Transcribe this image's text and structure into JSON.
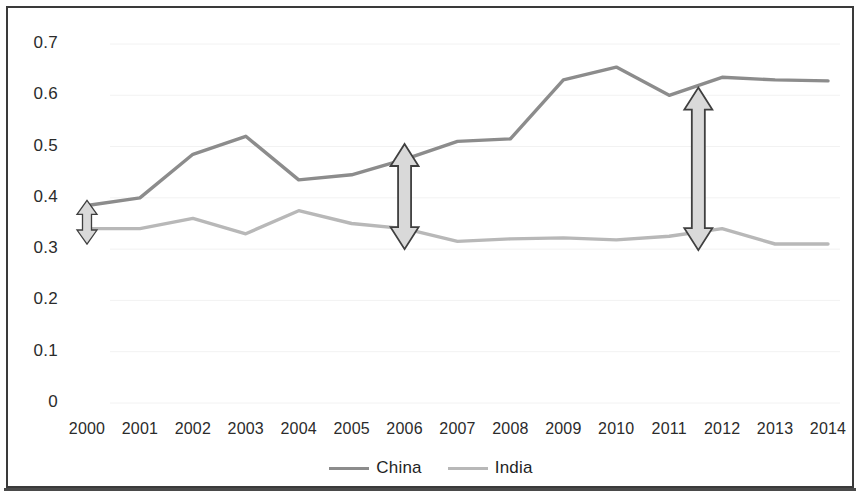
{
  "chart_data": {
    "type": "line",
    "title": "",
    "subtitle": "",
    "xlabel": "",
    "ylabel": "",
    "x": [
      2000,
      2001,
      2002,
      2003,
      2004,
      2005,
      2006,
      2007,
      2008,
      2009,
      2010,
      2011,
      2012,
      2013,
      2014
    ],
    "categories": [
      "2000",
      "2001",
      "2002",
      "2003",
      "2004",
      "2005",
      "2006",
      "2007",
      "2008",
      "2009",
      "2010",
      "2011",
      "2012",
      "2013",
      "2014"
    ],
    "series": [
      {
        "name": "China",
        "color": "#8c8c8c",
        "values": [
          0.385,
          0.4,
          0.485,
          0.52,
          0.435,
          0.445,
          0.475,
          0.51,
          0.515,
          0.63,
          0.655,
          0.6,
          0.635,
          0.63,
          0.628
        ]
      },
      {
        "name": "India",
        "color": "#b8b8b8",
        "values": [
          0.34,
          0.34,
          0.36,
          0.33,
          0.375,
          0.35,
          0.34,
          0.315,
          0.32,
          0.322,
          0.318,
          0.325,
          0.34,
          0.31,
          0.31
        ]
      }
    ],
    "ylim": [
      0,
      0.7
    ],
    "xlim": [
      2000,
      2014
    ],
    "yticks": [
      "0",
      "0.1",
      "0.2",
      "0.3",
      "0.4",
      "0.5",
      "0.6",
      "0.7"
    ],
    "ytick_values": [
      0,
      0.1,
      0.2,
      0.3,
      0.4,
      0.5,
      0.6,
      0.7
    ],
    "grid": false,
    "legend_position": "bottom",
    "annotations": [
      {
        "name": "gap-arrow-2000",
        "type": "double-headed-vertical-arrow",
        "x": 2000,
        "y_top": 0.395,
        "y_bottom": 0.31,
        "label": ""
      },
      {
        "name": "gap-arrow-2006",
        "type": "double-headed-vertical-arrow",
        "x": 2006,
        "y_top": 0.505,
        "y_bottom": 0.3,
        "label": ""
      },
      {
        "name": "gap-arrow-2011",
        "type": "double-headed-vertical-arrow",
        "x": 2011.55,
        "y_top": 0.615,
        "y_bottom": 0.298,
        "label": ""
      }
    ]
  },
  "legend": {
    "items": [
      {
        "label": "China",
        "color": "#8c8c8c"
      },
      {
        "label": "India",
        "color": "#b8b8b8"
      }
    ]
  },
  "colors": {
    "china_line": "#8c8c8c",
    "india_line": "#b8b8b8",
    "arrow_fill": "#d9d9d9",
    "arrow_stroke": "#3f3f3f",
    "border": "#3a3a3a",
    "text": "#2b2b2b",
    "background": "#ffffff"
  }
}
